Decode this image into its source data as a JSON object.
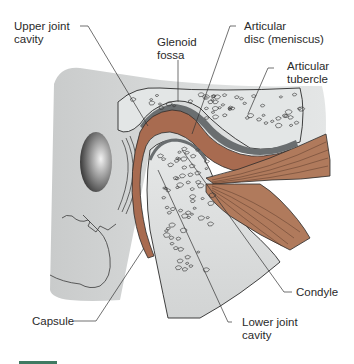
{
  "figure": {
    "colors": {
      "bone_gray": "#d4d6d6",
      "bone_light": "#e9ebeb",
      "muscle": "#b07a5c",
      "disc": "#a86b50",
      "outline": "#2b2b2b",
      "cartilage_dark": "#6a6e70",
      "footer_accent": "#3f7a62"
    }
  },
  "labels": {
    "upper_joint_cavity": [
      "Upper joint",
      "cavity"
    ],
    "glenoid_fossa": [
      "Glenoid",
      "fossa"
    ],
    "articular_disc": [
      "Articular",
      "disc (meniscus)"
    ],
    "articular_tubercle": [
      "Articular",
      "tubercle"
    ],
    "condyle": [
      "Condyle"
    ],
    "capsule": [
      "Capsule"
    ],
    "lower_joint_cavity": [
      "Lower joint",
      "cavity"
    ]
  }
}
